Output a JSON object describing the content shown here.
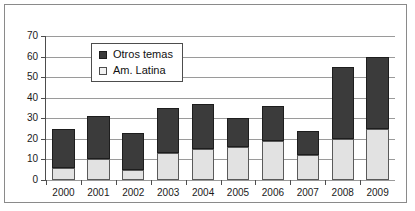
{
  "chart_data": {
    "type": "bar",
    "subtype": "stacked-column",
    "title": "",
    "xlabel": "",
    "ylabel": "",
    "categories": [
      "2000",
      "2001",
      "2002",
      "2003",
      "2004",
      "2005",
      "2006",
      "2007",
      "2008",
      "2009"
    ],
    "series": [
      {
        "name": "Am. Latina",
        "color": "#e2e2e2",
        "values": [
          6,
          10,
          5,
          13,
          15,
          16,
          19,
          12,
          20,
          25
        ]
      },
      {
        "name": "Otros temas",
        "color": "#3b3b3b",
        "values": [
          19,
          21,
          18,
          22,
          22,
          14,
          17,
          12,
          35,
          35
        ]
      }
    ],
    "totals": [
      25,
      31,
      23,
      35,
      37,
      30,
      36,
      24,
      55,
      60
    ],
    "ylim": [
      0,
      70
    ],
    "yticks": [
      0,
      10,
      20,
      30,
      40,
      50,
      60,
      70
    ],
    "ytick_labels": [
      "0",
      "10",
      "20",
      "30",
      "40",
      "50",
      "60",
      "70"
    ],
    "grid": "horizontal",
    "legend_position": "upper-left-inside",
    "legend": [
      {
        "label": "Otros temas",
        "key": "legend-swatch-dark"
      },
      {
        "label": "Am. Latina",
        "key": "legend-swatch-light"
      }
    ]
  }
}
